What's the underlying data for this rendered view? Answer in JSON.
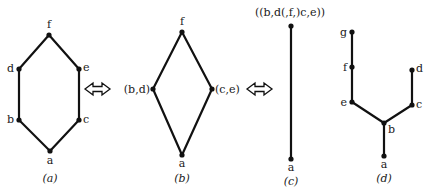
{
  "figures": [
    {
      "id": "a",
      "caption": "(a)",
      "nodes": [
        {
          "name": "f",
          "label": "f"
        },
        {
          "name": "d",
          "label": "d"
        },
        {
          "name": "e",
          "label": "e"
        },
        {
          "name": "b",
          "label": "b"
        },
        {
          "name": "c",
          "label": "c"
        },
        {
          "name": "a",
          "label": "a"
        }
      ],
      "edges": [
        [
          "a",
          "b"
        ],
        [
          "b",
          "d"
        ],
        [
          "d",
          "f"
        ],
        [
          "a",
          "c"
        ],
        [
          "c",
          "e"
        ],
        [
          "e",
          "f"
        ]
      ]
    },
    {
      "id": "b",
      "caption": "(b)",
      "nodes": [
        {
          "name": "f",
          "label": "f"
        },
        {
          "name": "bd",
          "label": "(b,d)"
        },
        {
          "name": "ce",
          "label": "(c,e)"
        },
        {
          "name": "a",
          "label": "a"
        }
      ],
      "edges": [
        [
          "a",
          "bd"
        ],
        [
          "bd",
          "f"
        ],
        [
          "a",
          "ce"
        ],
        [
          "ce",
          "f"
        ]
      ]
    },
    {
      "id": "c",
      "caption": "(c)",
      "nodes": [
        {
          "name": "top",
          "label": "((b,d(,f,)c,e))"
        },
        {
          "name": "a",
          "label": "a"
        }
      ],
      "edges": [
        [
          "a",
          "top"
        ]
      ]
    },
    {
      "id": "d",
      "caption": "(d)",
      "nodes": [
        {
          "name": "g",
          "label": "g"
        },
        {
          "name": "f",
          "label": "f"
        },
        {
          "name": "e",
          "label": "e"
        },
        {
          "name": "b",
          "label": "b"
        },
        {
          "name": "c",
          "label": "c"
        },
        {
          "name": "d",
          "label": "d"
        },
        {
          "name": "a",
          "label": "a"
        }
      ],
      "edges": [
        [
          "a",
          "b"
        ],
        [
          "b",
          "e"
        ],
        [
          "e",
          "f"
        ],
        [
          "f",
          "g"
        ],
        [
          "b",
          "c"
        ],
        [
          "c",
          "d"
        ]
      ]
    }
  ],
  "arrows": [
    {
      "between": [
        "a",
        "b"
      ],
      "type": "double-headed"
    },
    {
      "between": [
        "b",
        "c"
      ],
      "type": "double-headed"
    }
  ]
}
